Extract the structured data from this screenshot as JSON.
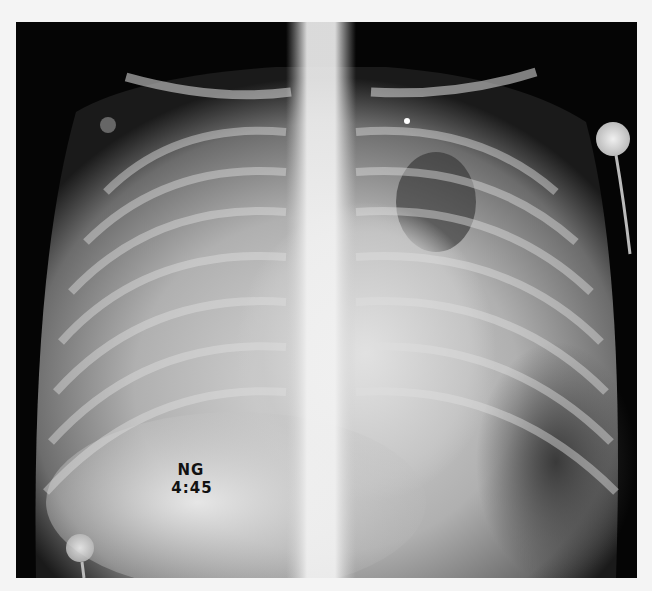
{
  "image": {
    "type": "chest radiograph (AP view)",
    "annotations": {
      "line1": "NG",
      "line2": "4:45"
    },
    "colors": {
      "border": "#f4f4f4",
      "film_background": "#050505",
      "dense_tissue": "#e8e8e8",
      "lung_field": "#6a6a6a"
    }
  }
}
